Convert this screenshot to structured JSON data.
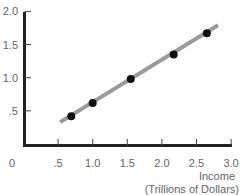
{
  "chart_data": {
    "type": "scatter",
    "title": "",
    "xlabel": "Income",
    "xlabel_sub": "(Trillions of Dollars)",
    "ylabel": "",
    "xlim": [
      0,
      3.0
    ],
    "ylim": [
      0,
      2.0
    ],
    "x_ticks": [
      ".5",
      "1.0",
      "1.5",
      "2.0",
      "2.5",
      "3.0"
    ],
    "x_tick_values": [
      0.5,
      1.0,
      1.5,
      2.0,
      2.5,
      3.0
    ],
    "y_ticks": [
      ".5",
      "1.0",
      "1.5",
      "2.0"
    ],
    "y_tick_values": [
      0.5,
      1.0,
      1.5,
      2.0
    ],
    "origin_label": "0",
    "grid": false,
    "series": [
      {
        "name": "observations",
        "x": [
          0.69,
          1.0,
          1.55,
          2.17,
          2.65
        ],
        "y": [
          0.42,
          0.62,
          0.98,
          1.35,
          1.67
        ]
      }
    ],
    "fit_line": {
      "x": [
        0.53,
        2.81
      ],
      "y": [
        0.33,
        1.79
      ],
      "color": "#9a9a9a"
    },
    "colors": {
      "axis": "#222222",
      "points": "#111111",
      "line": "#9a9a9a"
    }
  }
}
